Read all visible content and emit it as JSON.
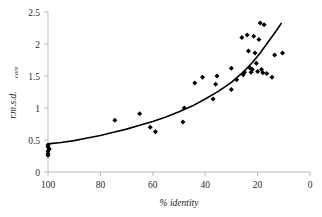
{
  "chart_data": {
    "type": "scatter",
    "title": "",
    "xlabel": "% identity",
    "ylabel": "r.m.s.d. core",
    "ylabel_main": "r.m.s.d.",
    "ylabel_subscript": "core",
    "xlim": [
      100,
      0
    ],
    "ylim": [
      0,
      2.5
    ],
    "x_axis_reversed": true,
    "xticks": [
      100,
      80,
      60,
      40,
      20,
      0
    ],
    "yticks": [
      0,
      0.5,
      1,
      1.5,
      2,
      2.5
    ],
    "xtick_labels": [
      "100",
      "80",
      "60",
      "40",
      "20",
      "0"
    ],
    "ytick_labels": [
      "0",
      "0.5",
      "1",
      "1.5",
      "2",
      "2.5"
    ],
    "grid": false,
    "legend": null,
    "marker": "diamond",
    "marker_color": "#000000",
    "curve_color": "#000000",
    "series": [
      {
        "name": "r.m.s.d. core vs % identity",
        "points": [
          [
            100.0,
            0.42
          ],
          [
            100.0,
            0.39
          ],
          [
            100.0,
            0.33
          ],
          [
            100.0,
            0.29
          ],
          [
            100.0,
            0.26
          ],
          [
            99.5,
            0.36
          ],
          [
            74.5,
            0.81
          ],
          [
            65.0,
            0.91
          ],
          [
            61.0,
            0.7
          ],
          [
            59.0,
            0.63
          ],
          [
            48.5,
            0.78
          ],
          [
            48.0,
            1.0
          ],
          [
            44.0,
            1.39
          ],
          [
            41.0,
            1.48
          ],
          [
            37.0,
            1.14
          ],
          [
            36.0,
            1.37
          ],
          [
            35.5,
            1.5
          ],
          [
            30.0,
            1.62
          ],
          [
            30.0,
            1.29
          ],
          [
            28.0,
            1.44
          ],
          [
            26.0,
            2.1
          ],
          [
            25.5,
            1.52
          ],
          [
            25.0,
            1.56
          ],
          [
            24.0,
            2.14
          ],
          [
            23.5,
            1.89
          ],
          [
            23.0,
            1.63
          ],
          [
            22.5,
            1.56
          ],
          [
            22.0,
            1.6
          ],
          [
            21.5,
            2.12
          ],
          [
            21.0,
            1.86
          ],
          [
            20.5,
            1.7
          ],
          [
            20.0,
            1.57
          ],
          [
            19.5,
            2.07
          ],
          [
            19.0,
            2.33
          ],
          [
            18.5,
            1.6
          ],
          [
            18.0,
            1.55
          ],
          [
            17.5,
            2.3
          ],
          [
            16.5,
            1.54
          ],
          [
            14.5,
            1.48
          ],
          [
            13.5,
            1.83
          ],
          [
            10.5,
            1.86
          ]
        ]
      }
    ],
    "fit_curve": {
      "name": "fitted exponential trend",
      "points": [
        [
          100.0,
          0.44
        ],
        [
          95.0,
          0.46
        ],
        [
          90.0,
          0.49
        ],
        [
          85.0,
          0.53
        ],
        [
          80.0,
          0.57
        ],
        [
          75.0,
          0.62
        ],
        [
          70.0,
          0.67
        ],
        [
          65.0,
          0.73
        ],
        [
          60.0,
          0.79
        ],
        [
          55.0,
          0.86
        ],
        [
          50.0,
          0.94
        ],
        [
          45.0,
          1.03
        ],
        [
          40.0,
          1.14
        ],
        [
          35.0,
          1.26
        ],
        [
          30.0,
          1.4
        ],
        [
          25.0,
          1.58
        ],
        [
          22.0,
          1.71
        ],
        [
          19.0,
          1.86
        ],
        [
          16.0,
          2.03
        ],
        [
          13.0,
          2.2
        ],
        [
          11.0,
          2.32
        ]
      ]
    }
  },
  "axes": {
    "y_label_main": "r.m.s.d.",
    "y_label_sub": "core",
    "x_label": "% identity"
  }
}
